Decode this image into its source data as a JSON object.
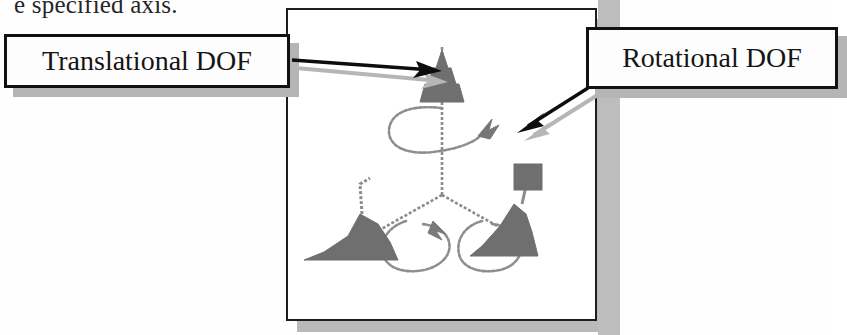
{
  "page": {
    "cropped_text_line": "e specified axis.",
    "background_color": "#fefefe"
  },
  "figure": {
    "frame_border_color": "#1d1d1d",
    "frame_shadow_color": "#b9b9b9",
    "background_color": "#ffffff",
    "geometry_color": "#808080",
    "handle_fill_color": "#6e6e6e",
    "axes": [
      {
        "name": "vertical-axis",
        "handle": "cone",
        "dof": "translational"
      },
      {
        "name": "left-axis",
        "handle": "cone",
        "dof": "translational"
      },
      {
        "name": "right-axis",
        "handle": "cube",
        "dof": "translational"
      }
    ],
    "rotation_loops": [
      {
        "name": "top-rotation-loop",
        "dof": "rotational"
      },
      {
        "name": "left-rotation-loop",
        "dof": "rotational"
      },
      {
        "name": "right-rotation-loop",
        "dof": "rotational"
      }
    ]
  },
  "callouts": {
    "translational": {
      "label": "Translational DOF",
      "border_color": "#111111",
      "fill_color": "#fdfdfd",
      "shadow_color": "#b5b5b5",
      "arrow_target": "vertical-axis-cone"
    },
    "rotational": {
      "label": "Rotational DOF",
      "border_color": "#111111",
      "fill_color": "#fdfdfd",
      "shadow_color": "#b5b5b5",
      "arrow_target": "top-rotation-loop-arrowhead"
    }
  },
  "arrows": {
    "translational_arrow_color": "#0d0d0d",
    "rotational_arrow_color": "#0d0d0d",
    "arrow_shadow_color": "#b0b0b0"
  }
}
